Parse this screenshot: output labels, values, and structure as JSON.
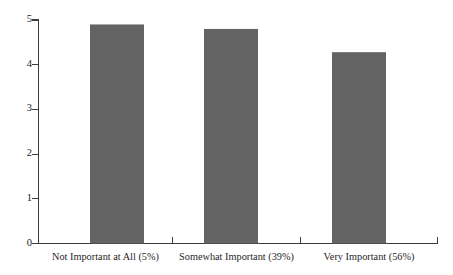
{
  "chart_data": {
    "type": "bar",
    "title": "",
    "subtitle": "",
    "xlabel": "",
    "ylabel": "",
    "categories": [
      "Not Important at All (5%)",
      "Somewhat Important (39%)",
      "Very Important (56%)"
    ],
    "values": [
      4.9,
      4.8,
      4.28
    ],
    "ylim": [
      0,
      5
    ],
    "ytick_labels": [
      "0",
      "1",
      "2",
      "3",
      "4",
      "5"
    ],
    "ytick_values": [
      0,
      1,
      2,
      3,
      4,
      5
    ],
    "grid": false,
    "legend": null,
    "legend_position": "none",
    "annotations": [],
    "bar_color": "#636363",
    "axis_color": "#3c3c3c",
    "background_color": "#ffffff"
  },
  "axes": {
    "y_axis_name": "value-axis",
    "x_axis_name": "category-axis"
  }
}
